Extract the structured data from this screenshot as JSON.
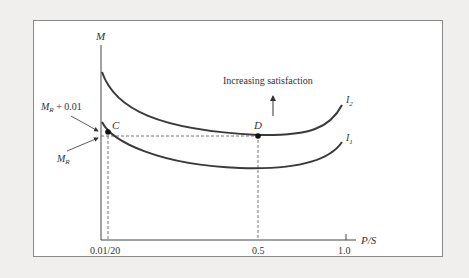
{
  "diagram": {
    "type": "indifference-curves",
    "axes": {
      "y_label": "M",
      "x_label": "P/S",
      "x_ticks": [
        "0.01/20",
        "0.5",
        "1.0"
      ]
    },
    "curves": [
      {
        "name": "I2",
        "label_main": "I",
        "label_sub": "2"
      },
      {
        "name": "I1",
        "label_main": "I",
        "label_sub": "1"
      }
    ],
    "points": [
      {
        "name": "C",
        "label": "C"
      },
      {
        "name": "D",
        "label": "D"
      }
    ],
    "annotations": {
      "increasing": "Increasing satisfaction",
      "mr_plus_main": "M",
      "mr_plus_sub": "R",
      "mr_plus_rest": " + 0.01",
      "mr_main": "M",
      "mr_sub": "R"
    },
    "colors": {
      "curve": "#3a3a3a",
      "axis": "#444444",
      "background": "#f0efed",
      "panel": "#ffffff"
    }
  }
}
